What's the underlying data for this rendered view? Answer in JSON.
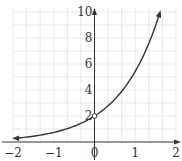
{
  "chart_data": {
    "type": "line",
    "title": "",
    "xlabel": "",
    "ylabel": "",
    "function": "y = 2e^x",
    "xlim": [
      -2,
      2
    ],
    "ylim": [
      0,
      10
    ],
    "grid": true,
    "x_ticks": [
      "−2",
      "−1",
      "0",
      "1",
      "2"
    ],
    "y_ticks": [
      "2",
      "4",
      "6",
      "8",
      "10"
    ],
    "series": [
      {
        "name": "curve",
        "x": [
          -2,
          -1.5,
          -1,
          -0.5,
          0,
          0.5,
          1,
          1.25,
          1.5,
          1.6
        ],
        "y": [
          0.27,
          0.45,
          0.74,
          1.21,
          2,
          3.3,
          5.44,
          6.98,
          8.96,
          9.9
        ]
      }
    ],
    "annotations": [
      {
        "type": "open-point",
        "x": 0,
        "y": 2
      }
    ]
  },
  "colors": {
    "curve": "#333333",
    "axis": "#333333",
    "grid": "#e2e2e2"
  }
}
